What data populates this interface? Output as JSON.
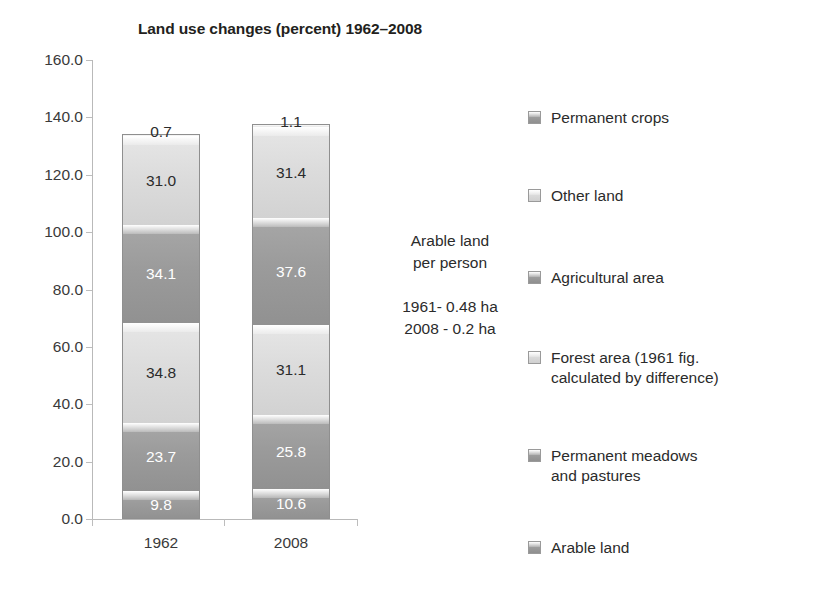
{
  "chart_data": {
    "type": "bar",
    "subtype": "stacked-column",
    "title": "Land use changes (percent) 1962–2008",
    "xlabel": "",
    "ylabel": "",
    "categories": [
      "1962",
      "2008"
    ],
    "ylim": [
      0.0,
      160.0
    ],
    "ytick_step": 20.0,
    "ytick_labels": [
      "160.0",
      "140.0",
      "120.0",
      "100.0",
      "80.0",
      "60.0",
      "40.0",
      "20.0",
      "0.0"
    ],
    "ytick_values": [
      160.0,
      140.0,
      120.0,
      100.0,
      80.0,
      60.0,
      40.0,
      20.0,
      0.0
    ],
    "grid": false,
    "legend_position": "right",
    "stack_order_bottom_to_top": [
      "Arable land",
      "Permanent meadows and pastures",
      "Forest area (1961 fig. calculated by difference)",
      "Agricultural area",
      "Other land",
      "Permanent crops"
    ],
    "series": [
      {
        "name": "Arable land",
        "values": [
          9.8,
          10.6
        ],
        "labels": [
          "9.8",
          "10.6"
        ],
        "shade": "dark"
      },
      {
        "name": "Permanent meadows and pastures",
        "values": [
          23.7,
          25.8
        ],
        "labels": [
          "23.7",
          "25.8"
        ],
        "shade": "dark"
      },
      {
        "name": "Forest area (1961 fig. calculated by difference)",
        "values": [
          34.8,
          31.1
        ],
        "labels": [
          "34.8",
          "31.1"
        ],
        "shade": "light"
      },
      {
        "name": "Agricultural area",
        "values": [
          34.1,
          37.6
        ],
        "labels": [
          "34.1",
          "37.6"
        ],
        "shade": "dark"
      },
      {
        "name": "Other land",
        "values": [
          31.0,
          31.4
        ],
        "labels": [
          "31.0",
          "31.4"
        ],
        "shade": "light"
      },
      {
        "name": "Permanent crops",
        "values": [
          0.7,
          1.1
        ],
        "labels": [
          "0.7",
          "1.1"
        ],
        "shade": "light"
      }
    ],
    "totals": [
      134.1,
      137.6
    ]
  },
  "legend": {
    "items": [
      {
        "label": "Permanent crops",
        "shade": "dark"
      },
      {
        "label": "Other land",
        "shade": "light"
      },
      {
        "label": "Agricultural area",
        "shade": "dark"
      },
      {
        "label": "Forest area (1961 fig.\ncalculated by difference)",
        "shade": "light"
      },
      {
        "label": "Permanent meadows\nand pastures",
        "shade": "dark"
      },
      {
        "label": "Arable land",
        "shade": "dark"
      }
    ]
  },
  "annotation": {
    "line1": "Arable land",
    "line2": "per person",
    "line3": "1961- 0.48 ha",
    "line4": "2008 - 0.2 ha"
  },
  "colors": {
    "dark_segment": "#9b9b9b",
    "light_segment": "#dcdcdc",
    "axis": "#bdbdbd",
    "text": "#2b2b2b",
    "background": "#ffffff"
  }
}
